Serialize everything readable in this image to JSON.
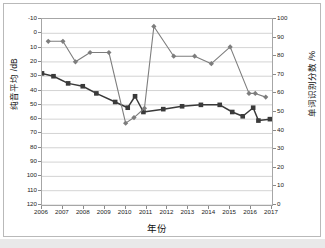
{
  "chart_data": {
    "type": "line",
    "title": "",
    "xlabel": "年份",
    "ylabel": "纯音平均 /dB",
    "ylabel_right": "单词识别分数 /%",
    "x": [
      2006,
      2007,
      2008,
      2009,
      2010,
      2011,
      2012,
      2013,
      2014,
      2015,
      2016,
      2017
    ],
    "x_tick_labels": [
      "2006",
      "2007",
      "2008",
      "2009",
      "2010",
      "2011",
      "2012",
      "2013",
      "2014",
      "2015",
      "2016",
      "2017"
    ],
    "xlim": [
      2006,
      2017
    ],
    "ylim": [
      -10,
      120
    ],
    "y_inverted": true,
    "y_tick_labels": [
      "-10",
      "0",
      "10",
      "20",
      "30",
      "40",
      "50",
      "60",
      "70",
      "80",
      "90",
      "100",
      "110",
      "120"
    ],
    "y_ticks": [
      -10,
      0,
      10,
      20,
      30,
      40,
      50,
      60,
      70,
      80,
      90,
      100,
      110,
      120
    ],
    "ylim_right": [
      0,
      100
    ],
    "y_right_tick_labels": [
      "0",
      "10",
      "20",
      "30",
      "40",
      "50",
      "60",
      "70",
      "80",
      "90",
      "100"
    ],
    "y_right_ticks": [
      0,
      10,
      20,
      30,
      40,
      50,
      60,
      70,
      80,
      90,
      100
    ],
    "grid": true,
    "legend": "none",
    "series": [
      {
        "name": "纯音平均 /dB",
        "axis": "left",
        "color": "#3a3a3a",
        "marker": "square",
        "x": [
          2006.0,
          2006.55,
          2007.25,
          2007.95,
          2008.6,
          2009.5,
          2010.1,
          2010.45,
          2010.85,
          2011.8,
          2012.7,
          2013.6,
          2014.5,
          2015.1,
          2015.6,
          2016.1,
          2016.35,
          2016.9
        ],
        "values": [
          28,
          30,
          35,
          37,
          42,
          48,
          52,
          44,
          55,
          53,
          51,
          50,
          50,
          55,
          58,
          52,
          61,
          60
        ]
      },
      {
        "name": "单词识别分数 /%",
        "axis": "right",
        "color": "#7d7d7d",
        "marker": "diamond",
        "x": [
          2006.3,
          2007.0,
          2007.6,
          2008.3,
          2009.2,
          2010.0,
          2010.4,
          2010.9,
          2011.35,
          2012.3,
          2013.3,
          2014.1,
          2015.0,
          2015.9,
          2016.2,
          2016.7
        ],
        "values": [
          88,
          88,
          77,
          82,
          82,
          44,
          47,
          52,
          96,
          80,
          80,
          76,
          85,
          60,
          60,
          58
        ]
      }
    ]
  },
  "axes": {
    "left_title": "纯音平均 /dB",
    "right_title": "单词识别分数 /%",
    "bottom_title": "年份"
  }
}
